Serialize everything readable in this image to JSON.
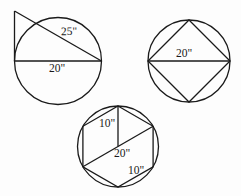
{
  "figure": {
    "background_color": "#fdfdfd",
    "stroke_color": "#1a1a1a",
    "units": "inches"
  },
  "figures": [
    {
      "id": "figure-1",
      "name": "circle-with-right-triangle",
      "description": "Circle with horizontal diameter and a right triangle whose hypotenuse is a secant line",
      "circle": {
        "cx": 58,
        "cy": 61,
        "r": 43.5
      },
      "labels": {
        "hypotenuse": "25\"",
        "diameter": "20\""
      }
    },
    {
      "id": "figure-2",
      "name": "circle-with-inscribed-square",
      "description": "Circle with an inscribed square rotated 45 degrees, horizontal diagonal drawn",
      "circle": {
        "cx": 189,
        "cy": 61,
        "r": 41
      },
      "labels": {
        "diagonal": "20\""
      }
    },
    {
      "id": "figure-3",
      "name": "circle-with-inscribed-hexagon",
      "description": "Circle with an inscribed regular hexagon, one long diagonal and one radius drawn",
      "circle": {
        "cx": 118,
        "cy": 146.5,
        "r": 40.5
      },
      "labels": {
        "radius": "10\"",
        "long_diagonal": "20\"",
        "side": "10\""
      }
    }
  ]
}
